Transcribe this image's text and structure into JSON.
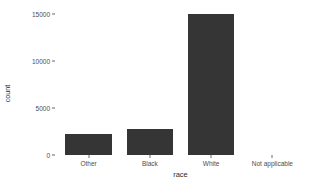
{
  "chart_data": {
    "type": "bar",
    "title": "",
    "subtitle": "",
    "xlabel": "race",
    "ylabel": "count",
    "categories": [
      "Other",
      "Black",
      "White",
      "Not applicable"
    ],
    "values": [
      2200,
      2750,
      15100,
      0
    ],
    "ylim": [
      0,
      15900
    ],
    "yticks": [
      0,
      5000,
      10000,
      15000
    ],
    "ytick_labels": [
      "0",
      "5000",
      "10000",
      "15000"
    ],
    "grid": false,
    "legend": "none",
    "bar_color": "#353535",
    "background_color": "#ffffff",
    "axis_text_color": "#4d4d4d",
    "axis_line_color": "#6a6a6a"
  }
}
